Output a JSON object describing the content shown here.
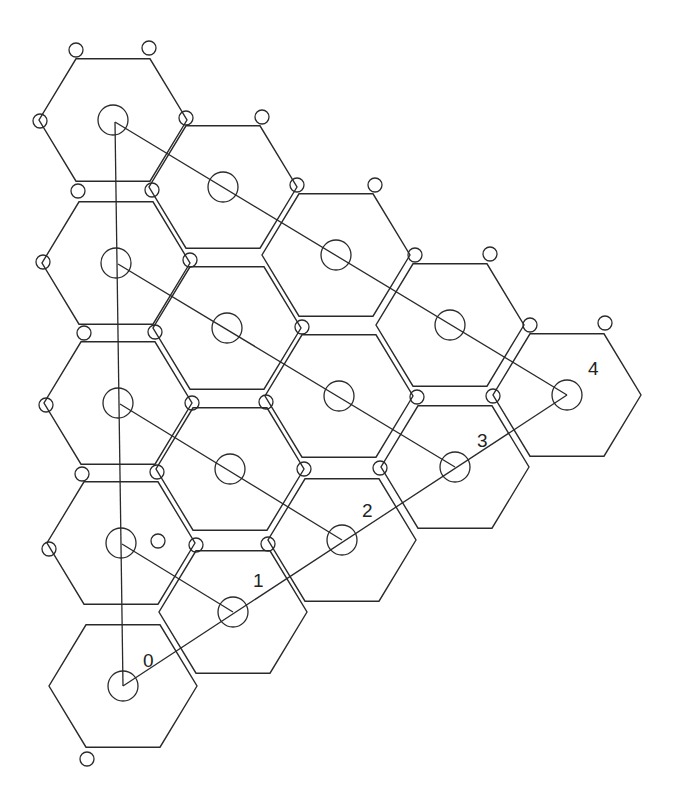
{
  "diagram": {
    "stroke_color": "#2a2a2a",
    "background": "#ffffff",
    "hex_radius": 74,
    "center_circle_radius": 15,
    "vertex_circle_radius": 7,
    "hexes": [
      {
        "id": "c0r0",
        "cx": 113,
        "cy": 120
      },
      {
        "id": "c0r1",
        "cx": 116,
        "cy": 263
      },
      {
        "id": "c0r2",
        "cx": 118,
        "cy": 403
      },
      {
        "id": "c0r3",
        "cx": 121,
        "cy": 543
      },
      {
        "id": "c0r4",
        "cx": 123,
        "cy": 686
      },
      {
        "id": "c1r0",
        "cx": 223,
        "cy": 187
      },
      {
        "id": "c1r1",
        "cx": 227,
        "cy": 328
      },
      {
        "id": "c1r2",
        "cx": 230,
        "cy": 469
      },
      {
        "id": "c1r3",
        "cx": 233,
        "cy": 612
      },
      {
        "id": "c2r0",
        "cx": 336,
        "cy": 255
      },
      {
        "id": "c2r1",
        "cx": 339,
        "cy": 396
      },
      {
        "id": "c2r2",
        "cx": 342,
        "cy": 540
      },
      {
        "id": "c3r0",
        "cx": 450,
        "cy": 325
      },
      {
        "id": "c3r1",
        "cx": 455,
        "cy": 467
      },
      {
        "id": "c4r0",
        "cx": 567,
        "cy": 395
      }
    ],
    "vertex_markers": [
      [
        76,
        50
      ],
      [
        149,
        48
      ],
      [
        40,
        121
      ],
      [
        186,
        118
      ],
      [
        262,
        117
      ],
      [
        78,
        191
      ],
      [
        152,
        190
      ],
      [
        43,
        262
      ],
      [
        190,
        260
      ],
      [
        297,
        185
      ],
      [
        375,
        185
      ],
      [
        302,
        327
      ],
      [
        415,
        255
      ],
      [
        490,
        254
      ],
      [
        530,
        325
      ],
      [
        605,
        323
      ],
      [
        46,
        405
      ],
      [
        192,
        403
      ],
      [
        266,
        402
      ],
      [
        304,
        469
      ],
      [
        380,
        468
      ],
      [
        417,
        397
      ],
      [
        493,
        396
      ],
      [
        49,
        549
      ],
      [
        196,
        545
      ],
      [
        268,
        544
      ],
      [
        87,
        759
      ],
      [
        158,
        541
      ],
      [
        155,
        332
      ],
      [
        84,
        333
      ],
      [
        82,
        474
      ],
      [
        157,
        472
      ]
    ],
    "connection_lines": [
      {
        "from": [
          115,
          122
        ],
        "to": [
          123,
          686
        ]
      },
      {
        "from": [
          115,
          122
        ],
        "to": [
          567,
          395
        ]
      },
      {
        "from": [
          118,
          264
        ],
        "to": [
          455,
          467
        ]
      },
      {
        "from": [
          120,
          404
        ],
        "to": [
          342,
          540
        ]
      },
      {
        "from": [
          122,
          544
        ],
        "to": [
          233,
          612
        ]
      },
      {
        "from": [
          123,
          686
        ],
        "to": [
          567,
          395
        ]
      }
    ],
    "labels": [
      {
        "text": "0",
        "x": 143,
        "y": 660
      },
      {
        "text": "1",
        "x": 253,
        "y": 580
      },
      {
        "text": "2",
        "x": 362,
        "y": 510
      },
      {
        "text": "3",
        "x": 477,
        "y": 440
      },
      {
        "text": "4",
        "x": 588,
        "y": 368
      }
    ]
  }
}
